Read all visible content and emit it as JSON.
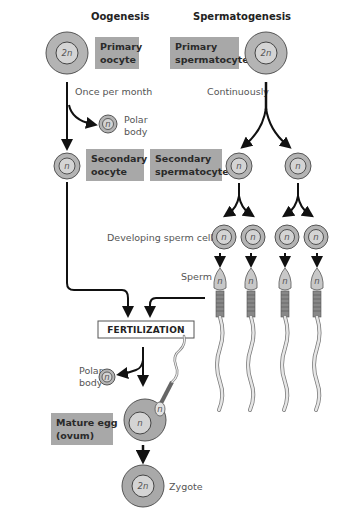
{
  "headers": {
    "oogenesis": "Oogenesis",
    "spermatogenesis": "Spermatogenesis"
  },
  "boxes": {
    "primary_oocyte": [
      "Primary",
      "oocyte"
    ],
    "primary_spermatocyte": [
      "Primary",
      "spermatocyte"
    ],
    "secondary_oocyte": [
      "Secondary",
      "oocyte"
    ],
    "secondary_spermatocyte": [
      "Secondary",
      "spermatocyte"
    ],
    "mature_egg": [
      "Mature egg",
      "(ovum)"
    ],
    "fertilization": "FERTILIZATION"
  },
  "labels": {
    "once_per_month": "Once per month",
    "continuously": "Continuously",
    "polar_body_1": [
      "Polar",
      "body"
    ],
    "polar_body_2": [
      "Polar",
      "body"
    ],
    "developing_sperm": "Developing sperm cells",
    "sperm": "Sperm",
    "zygote": "Zygote"
  },
  "ploidy": {
    "diploid": "2n",
    "haploid": "n"
  },
  "colors": {
    "box_fill": "#a8a8a8",
    "cell_outer": "#b4b4b4",
    "cell_inner": "#d2d2d2",
    "egg_outer": "#a9a9a9",
    "arrow": "#111111"
  }
}
